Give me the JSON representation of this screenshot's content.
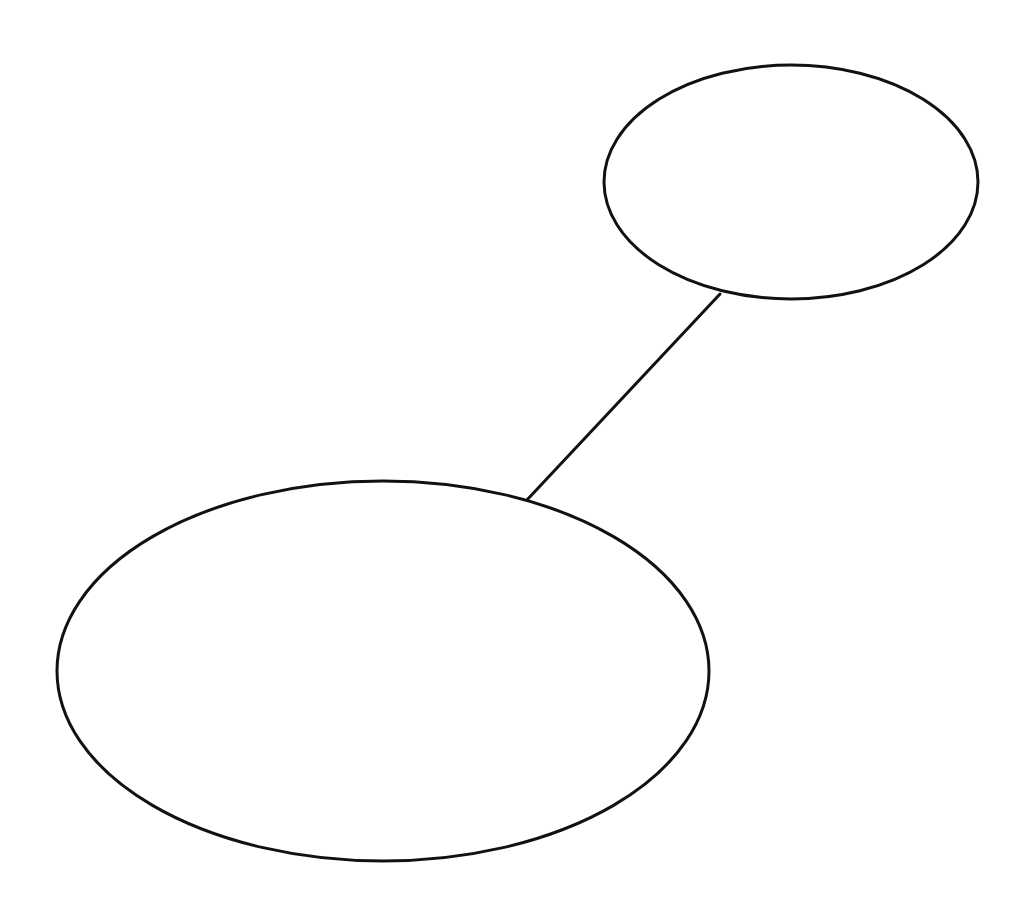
{
  "diagram": {
    "background": "#ffffff",
    "stroke_color": "#111111",
    "stroke_width": 3,
    "nodes": [
      {
        "id": "node-top-right",
        "shape": "ellipse",
        "cx": 791,
        "cy": 182,
        "rx": 187,
        "ry": 117,
        "label": ""
      },
      {
        "id": "node-bottom-left",
        "shape": "ellipse",
        "cx": 383,
        "cy": 671,
        "rx": 326,
        "ry": 190,
        "label": ""
      }
    ],
    "edges": [
      {
        "from": "node-top-right",
        "to": "node-bottom-left",
        "x1": 720,
        "y1": 294,
        "x2": 526,
        "y2": 501
      }
    ]
  }
}
